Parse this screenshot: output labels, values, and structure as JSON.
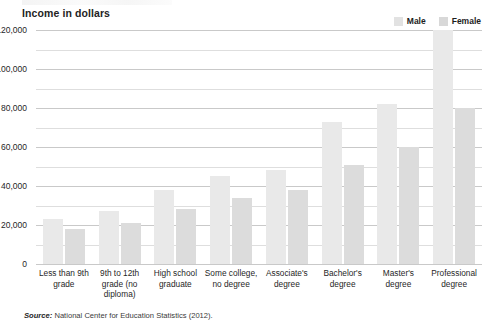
{
  "chart_data": {
    "type": "bar",
    "title": "Income in dollars",
    "xlabel": "",
    "ylabel": "Income in dollars",
    "ylim": [
      0,
      120000
    ],
    "ytick_step": 20000,
    "gridline_step": 10000,
    "grid": true,
    "legend_position": "top-right",
    "categories": [
      "Less than 9th grade",
      "9th to 12th grade (no diploma)",
      "High school graduate",
      "Some college, no degree",
      "Associate's degree",
      "Bachelor's degree",
      "Master's degree",
      "Professional degree"
    ],
    "tick_labels": [
      "0",
      "20,000",
      "40,000",
      "60,000",
      "80,000",
      "100,000",
      "120,000"
    ],
    "tick_values": [
      0,
      20000,
      40000,
      60000,
      80000,
      100000,
      120000
    ],
    "series": [
      {
        "name": "Male",
        "color": "#e9e9e9",
        "values": [
          23000,
          27000,
          38000,
          45000,
          48000,
          73000,
          82000,
          132000
        ]
      },
      {
        "name": "Female",
        "color": "#dcdcdc",
        "values": [
          18000,
          21000,
          28000,
          34000,
          38000,
          51000,
          60000,
          80000
        ]
      }
    ],
    "annotations": [
      "Professional degree male bar extends above the 120,000 axis maximum and is clipped at the plot top."
    ],
    "source": "National Center for Education Statistics (2012).",
    "source_prefix": "Source:"
  }
}
